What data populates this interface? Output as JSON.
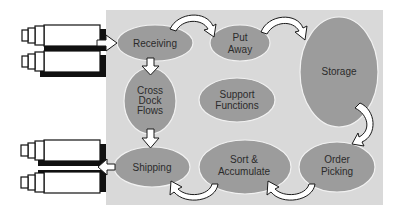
{
  "diagram": {
    "type": "warehouse-process-flow",
    "colors": {
      "panel": "#d9d9d9",
      "node_fill": "#9c9c9c",
      "node_stroke": "#f2f2f2",
      "arrow_fill": "#ffffff",
      "arrow_stroke": "#1a1a1a",
      "truck_body": "#ffffff",
      "truck_shadow": "#111111",
      "text": "#2b2b2b"
    },
    "nodes": [
      {
        "id": "receiving",
        "lines": [
          "Receiving"
        ]
      },
      {
        "id": "put-away",
        "lines": [
          "Put",
          "Away"
        ]
      },
      {
        "id": "storage",
        "lines": [
          "Storage"
        ]
      },
      {
        "id": "cross-dock-flows",
        "lines": [
          "Cross",
          "Dock",
          "Flows"
        ]
      },
      {
        "id": "support-functions",
        "lines": [
          "Support",
          "Functions"
        ]
      },
      {
        "id": "shipping",
        "lines": [
          "Shipping"
        ]
      },
      {
        "id": "sort-accumulate",
        "lines": [
          "Sort &",
          "Accumulate"
        ]
      },
      {
        "id": "order-picking",
        "lines": [
          "Order",
          "Picking"
        ]
      }
    ],
    "edges": [
      {
        "from": "inbound-trucks",
        "to": "receiving"
      },
      {
        "from": "receiving",
        "to": "put-away"
      },
      {
        "from": "put-away",
        "to": "storage"
      },
      {
        "from": "storage",
        "to": "order-picking"
      },
      {
        "from": "order-picking",
        "to": "sort-accumulate"
      },
      {
        "from": "sort-accumulate",
        "to": "shipping"
      },
      {
        "from": "receiving",
        "to": "cross-dock-flows"
      },
      {
        "from": "cross-dock-flows",
        "to": "shipping"
      },
      {
        "from": "shipping",
        "to": "outbound-trucks"
      }
    ],
    "trucks": {
      "inbound_count": 2,
      "outbound_count": 2
    }
  }
}
